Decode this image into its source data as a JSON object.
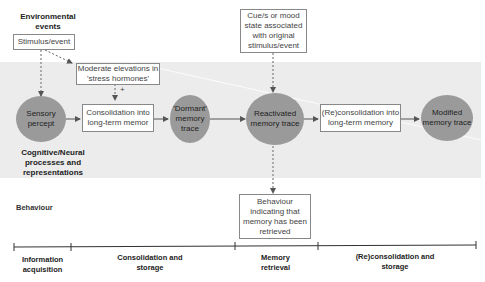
{
  "labels": {
    "environmental_events": "Environmental events",
    "cognitive_neural": "Cognitive/Neural processes and representations",
    "behaviour": "Behaviour"
  },
  "boxes": {
    "stimulus": "Stimulus/event",
    "stress": "Moderate elevations in 'stress hormones'",
    "consolidation": "Consolidation into long-term memor",
    "cue": "Cue/s or mood state associated with original stimulus/event",
    "reconsolidation": "(Re)consolidation into long-term memory",
    "behaviour_retrieved": "Behaviour indicating that memory has been retrieved"
  },
  "nodes": {
    "sensory": "Sensory percept",
    "dormant": "'Dormant' memory trace",
    "reactivated": "Reactivated memory trace",
    "modified": "Modified memory trace"
  },
  "annotations": {
    "plus": "+"
  },
  "timeline": {
    "phases": [
      "Information acquisition",
      "Consolidation and storage",
      "Memory retrieval",
      "(Re)consolidation and storage"
    ]
  },
  "colors": {
    "band": "#ececec",
    "node_fill": "#9a9a9a",
    "line": "#555555"
  }
}
